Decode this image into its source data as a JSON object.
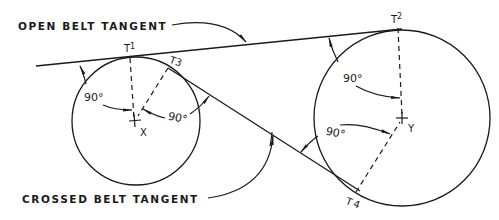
{
  "diagram": {
    "labels": {
      "open_belt": "OPEN BELT TANGENT",
      "crossed_belt": "CROSSED BELT TANGENT"
    },
    "points": {
      "t1": {
        "letter": "T",
        "index": "1"
      },
      "t2": {
        "letter": "T",
        "index": "2"
      },
      "t3": {
        "letter": "T",
        "index": "3"
      },
      "t4": {
        "letter": "T",
        "index": "4"
      }
    },
    "centers": {
      "x": "X",
      "y": "Y"
    },
    "angles": {
      "a1": "90°",
      "a2": "90°",
      "a3": "90°",
      "a4": "90°"
    },
    "colors": {
      "ink": "#1a1a1a",
      "background": "#ffffff"
    }
  }
}
